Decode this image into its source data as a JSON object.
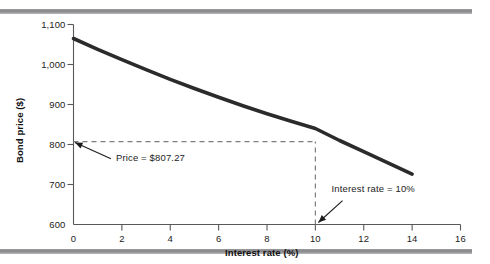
{
  "figure": {
    "background_color": "#ffffff",
    "frame_color": "#8a8a8e"
  },
  "chart_data": {
    "type": "line",
    "title": "",
    "subtitle": "",
    "xlabel": "Interest rate (%)",
    "ylabel": "Bond price ($)",
    "xlim": [
      0,
      16
    ],
    "ylim": [
      600,
      1100
    ],
    "grid": false,
    "legend": null,
    "xticks": [
      0,
      2,
      4,
      6,
      8,
      10,
      12,
      14,
      16
    ],
    "xtick_labels": [
      "0",
      "2",
      "4",
      "6",
      "8",
      "10",
      "12",
      "14",
      "16"
    ],
    "yticks": [
      600,
      700,
      800,
      900,
      1000,
      1100
    ],
    "ytick_labels": [
      "600",
      "700",
      "800",
      "900",
      "1,000",
      "1,100"
    ],
    "series": [
      {
        "name": "Bond price",
        "color": "#2b2b2b",
        "x": [
          0,
          1,
          2,
          3,
          4,
          5,
          6,
          7,
          8,
          9,
          10,
          11,
          12,
          13,
          14
        ],
        "y": [
          1065,
          1038,
          1012,
          987,
          963,
          940,
          918,
          897,
          877,
          858,
          840,
          810,
          782,
          754,
          726
        ]
      }
    ],
    "annotations": [
      {
        "id": "price-annotation",
        "text": "Price = $807.27",
        "point_x": 0,
        "point_y": 807.27,
        "label_x": 1.3,
        "label_y": 752
      },
      {
        "id": "rate-annotation",
        "text": "Interest rate = 10%",
        "point_x": 10,
        "point_y": 600,
        "label_x": 11.0,
        "label_y": 672
      }
    ],
    "guides": [
      {
        "id": "horizontal-price-guide",
        "orientation": "horizontal",
        "value": 807.27,
        "from": 0,
        "to": 10,
        "style": "dashed"
      },
      {
        "id": "vertical-rate-guide",
        "orientation": "vertical",
        "value": 10,
        "from": 600,
        "to": 807.27,
        "style": "dashed"
      }
    ]
  }
}
